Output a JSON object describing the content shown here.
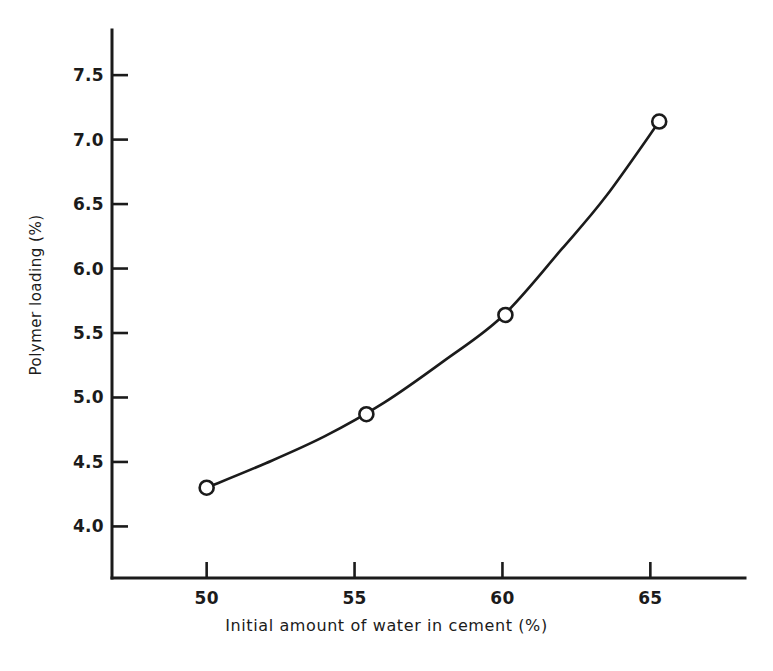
{
  "chart_data": {
    "type": "line",
    "title": "",
    "xlabel": "Initial amount of water in cement (%)",
    "ylabel": "Polymer loading (%)",
    "xlim": [
      46.8,
      68.2
    ],
    "ylim": [
      3.6,
      7.85
    ],
    "xticks": [
      50,
      55,
      60,
      65
    ],
    "xtick_labels": [
      "50",
      "55",
      "60",
      "65"
    ],
    "yticks": [
      4.0,
      4.5,
      5.0,
      5.5,
      6.0,
      6.5,
      7.0,
      7.5
    ],
    "ytick_labels": [
      "4.0",
      "4.5",
      "5.0",
      "5.5",
      "6.0",
      "6.5",
      "7.0",
      "7.5"
    ],
    "grid": false,
    "legend": false,
    "tick_direction": "in",
    "axes_style": "left-bottom-spines-only",
    "marker": "open-circle",
    "line_color": "#1b1b1b",
    "marker_edge_color": "#1b1b1b",
    "marker_face_color": "#ffffff",
    "x": [
      50.0,
      55.4,
      60.1,
      65.3
    ],
    "y": [
      4.3,
      4.87,
      5.64,
      7.14
    ],
    "series": [
      {
        "name": "Polymer loading vs initial water",
        "x": [
          50.0,
          55.4,
          60.1,
          65.3
        ],
        "values": [
          4.3,
          4.87,
          5.64,
          7.14
        ]
      }
    ],
    "fitted_curve_x": [
      50.0,
      52.0,
      54.0,
      56.0,
      58.0,
      60.0,
      62.0,
      63.5,
      65.3
    ],
    "fitted_curve_y": [
      4.3,
      4.49,
      4.7,
      4.96,
      5.28,
      5.63,
      6.15,
      6.56,
      7.14
    ]
  },
  "axis": {
    "xlabel": "Initial amount of water in cement (%)",
    "ylabel": "Polymer loading (%)"
  }
}
